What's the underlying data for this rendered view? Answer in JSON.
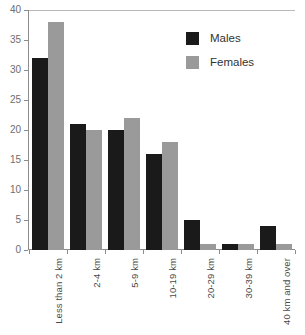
{
  "chart_data": {
    "type": "bar",
    "title": "",
    "subtitle": "",
    "xlabel": "",
    "ylabel": "",
    "categories": [
      "Less than 2 km",
      "2-4 km",
      "5-9 km",
      "10-19 km",
      "20-29 km",
      "30-39 km",
      "40 km and over"
    ],
    "series": [
      {
        "name": "Males",
        "color": "#1a1a1a",
        "values": [
          32,
          21,
          20,
          16,
          5,
          1,
          4
        ]
      },
      {
        "name": "Females",
        "color": "#9a9a9a",
        "values": [
          38,
          20,
          22,
          18,
          1,
          1,
          1
        ]
      }
    ],
    "ylim": [
      0,
      40
    ],
    "ytick_values": [
      0,
      5,
      10,
      15,
      20,
      25,
      30,
      35,
      40
    ],
    "ytick_labels": [
      "0",
      "5",
      "10",
      "15",
      "20",
      "25",
      "30",
      "35",
      "40"
    ],
    "grid": false,
    "legend_position": "upper-right",
    "legend_entries": [
      "Males",
      "Females"
    ]
  }
}
